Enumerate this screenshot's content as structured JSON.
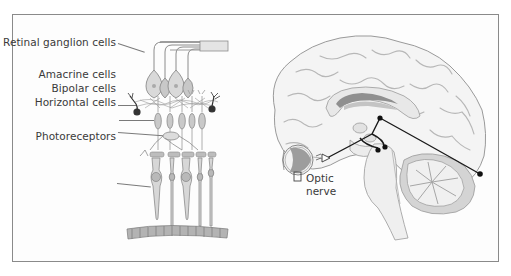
{
  "figure": {
    "panels": [
      {
        "id": "retina",
        "title": "Retina cross-section",
        "labels": [
          {
            "text": "Retinal ganglion cells"
          },
          {
            "text": "Amacrine cells"
          },
          {
            "text": "Bipolar cells"
          },
          {
            "text": "Horizontal cells"
          },
          {
            "text": "Photoreceptors"
          }
        ]
      },
      {
        "id": "brain",
        "title": "Sagittal brain section",
        "labels": [
          {
            "text": "Optic\nnerve",
            "line1": "Optic",
            "line2": "nerve"
          }
        ]
      }
    ],
    "colors": {
      "frame": "#8a8a8a",
      "cell_fill": "#d6d6d6",
      "cell_stroke": "#8c8c8c",
      "brain_fill": "#f3f3f3",
      "brain_stroke": "#9a9a9a",
      "pathway": "#1a1a1a",
      "corpus_dark": "#8f8f8f",
      "corpus_light": "#c4c4c4",
      "eye_fill": "#9d9d9d"
    }
  }
}
